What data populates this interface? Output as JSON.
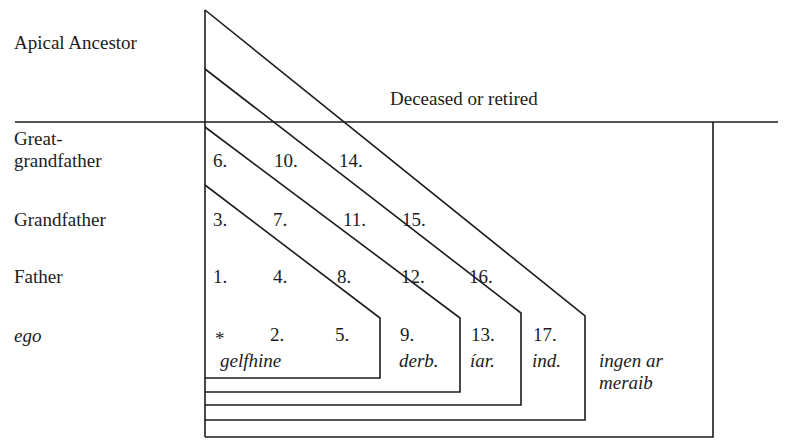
{
  "generations": {
    "apical": "Apical Ancestor",
    "great_1": "Great-",
    "great_2": "grandfather",
    "grandfather": "Grandfather",
    "father": "Father",
    "ego": "ego"
  },
  "header": {
    "deceased": "Deceased or retired"
  },
  "cells": {
    "n1": "1.",
    "n2": "2.",
    "n3": "3.",
    "n4": "4.",
    "n5": "5.",
    "n6": "6.",
    "n7": "7.",
    "n8": "8.",
    "n9": "9.",
    "n10": "10.",
    "n11": "11.",
    "n12": "12.",
    "n13": "13.",
    "n14": "14.",
    "n15": "15.",
    "n16": "16.",
    "n17": "17.",
    "ego_marker": "*"
  },
  "groups": {
    "gelfhine": "gelfhine",
    "derb": "derb.",
    "iar": "íar.",
    "ind": "ind.",
    "ingen_1": "ingen ar",
    "ingen_2": "meraib"
  },
  "colors": {
    "line": "#1c1c1c",
    "background": "#ffffff"
  }
}
